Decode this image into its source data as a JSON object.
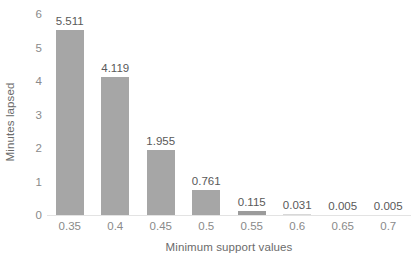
{
  "chart_data": {
    "type": "bar",
    "title": "",
    "xlabel": "Minimum support values",
    "ylabel": "Minutes lapsed",
    "categories": [
      "0.35",
      "0.4",
      "0.45",
      "0.5",
      "0.55",
      "0.6",
      "0.65",
      "0.7"
    ],
    "values": [
      5.511,
      4.119,
      1.955,
      0.761,
      0.115,
      0.031,
      0.005,
      0.005
    ],
    "value_labels": [
      "5.511",
      "4.119",
      "1.955",
      "0.761",
      "0.115",
      "0.031",
      "0.005",
      "0.005"
    ],
    "ylim": [
      0,
      6
    ],
    "yticks": [
      0,
      1,
      2,
      3,
      4,
      5,
      6
    ],
    "ytick_labels": [
      "0",
      "1",
      "2",
      "3",
      "4",
      "5",
      "6"
    ],
    "grid": false,
    "legend": false,
    "legend_position": "none",
    "bar_color": "#a6a6a6",
    "label_color": "#595959",
    "axis_text_color": "#8a8a8a",
    "axis_title_color": "#6b6b6b",
    "background": "#ffffff"
  }
}
